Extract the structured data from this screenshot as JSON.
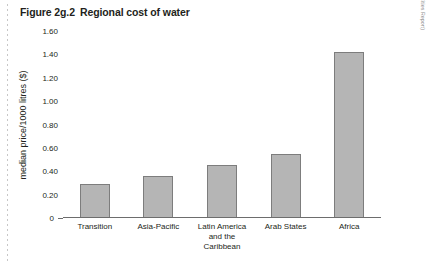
{
  "figure": {
    "number": "Figure 2g.2",
    "title": "Regional cost of water",
    "source": "Source: UNCHS 2001b (in UN State of World Cities Report)"
  },
  "chart_data": {
    "type": "bar",
    "title": "Regional cost of water",
    "xlabel": "",
    "ylabel": "median price/1000 litres ($)",
    "ylim": [
      0,
      1.6
    ],
    "grid": false,
    "legend": "none",
    "categories": [
      "Transition",
      "Asia-Pacific",
      "Latin America and the Caribbean",
      "Arab States",
      "Africa"
    ],
    "values": [
      0.29,
      0.36,
      0.45,
      0.55,
      1.42
    ],
    "ytick_labels": [
      "0",
      "0.20",
      "0.40",
      "0.60",
      "0.80",
      "1.00",
      "1.20",
      "1.40",
      "1.60"
    ],
    "ytick_values": [
      0,
      0.2,
      0.4,
      0.6,
      0.8,
      1.0,
      1.2,
      1.4,
      1.6
    ],
    "bar_color": "#b5b5b5",
    "bar_border_color": "#7d7d7d",
    "axis_color": "#6d6d6d"
  },
  "x_label_lines": [
    [
      "Transition"
    ],
    [
      "Asia-Pacific"
    ],
    [
      "Latin America",
      "and the",
      "Caribbean"
    ],
    [
      "Arab States"
    ],
    [
      "Africa"
    ]
  ]
}
